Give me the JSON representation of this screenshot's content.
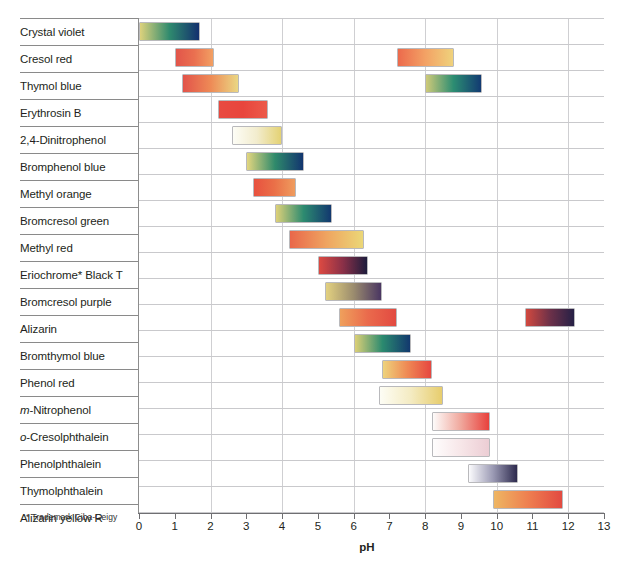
{
  "chart_data": {
    "type": "bar",
    "title": "",
    "subtitle": "",
    "xlabel": "pH",
    "ylabel": "",
    "xlim": [
      0,
      13
    ],
    "ylim": null,
    "grid": true,
    "grid_interval": 2,
    "legend": "none",
    "orientation": "horizontal",
    "note": "Horizontal gradient range bars showing pH transition intervals of acid-base indicators",
    "tick_labels": [
      "0",
      "1",
      "2",
      "3",
      "4",
      "5",
      "6",
      "7",
      "8",
      "9",
      "10",
      "11",
      "12",
      "13"
    ],
    "categories": [
      "Crystal violet",
      "Cresol red",
      "Thymol blue",
      "Erythrosin B",
      "2,4-Dinitrophenol",
      "Bromphenol blue",
      "Methyl orange",
      "Bromcresol green",
      "Methyl red",
      "Eriochrome* Black T",
      "Bromcresol purple",
      "Alizarin",
      "Bromthymol blue",
      "Phenol red",
      "m-Nitrophenol",
      "o-Cresolphthalein",
      "Phenolphthalein",
      "Thymolphthalein",
      "Alizarin yellow R"
    ],
    "indicators": [
      {
        "name": "Crystal violet",
        "label_html": "Crystal violet",
        "bands": [
          {
            "start": 0.0,
            "end": 1.7,
            "color_start": "#ddd27c",
            "color_mid": "#2f8a6e",
            "color_end": "#13306e"
          }
        ]
      },
      {
        "name": "Cresol red",
        "label_html": "Cresol red",
        "bands": [
          {
            "start": 1.0,
            "end": 2.1,
            "color_start": "#e2554a",
            "color_mid": "#ea7050",
            "color_end": "#f2a063"
          },
          {
            "start": 7.2,
            "end": 8.8,
            "color_start": "#ec6a4c",
            "color_mid": "#f3a265",
            "color_end": "#efd27c"
          }
        ]
      },
      {
        "name": "Thymol blue",
        "label_html": "Thymol blue",
        "bands": [
          {
            "start": 1.2,
            "end": 2.8,
            "color_start": "#e2534a",
            "color_mid": "#ee8a56",
            "color_end": "#ead784"
          },
          {
            "start": 8.0,
            "end": 9.6,
            "color_start": "#cfca79",
            "color_mid": "#2c8d72",
            "color_end": "#123a72"
          }
        ]
      },
      {
        "name": "Erythrosin B",
        "label_html": "Erythrosin B",
        "bands": [
          {
            "start": 2.2,
            "end": 3.6,
            "color_start": "#e84a41",
            "color_mid": "#e8453c",
            "color_end": "#ec5a4a"
          }
        ]
      },
      {
        "name": "2,4-Dinitrophenol",
        "label_html": "2,4-Dinitrophenol",
        "bands": [
          {
            "start": 2.6,
            "end": 4.0,
            "color_start": "#fdfdf6",
            "color_mid": "#f2eccd",
            "color_end": "#e4d274"
          }
        ]
      },
      {
        "name": "Bromphenol blue",
        "label_html": "Bromphenol blue",
        "bands": [
          {
            "start": 3.0,
            "end": 4.6,
            "color_start": "#e3d67f",
            "color_mid": "#2f8a6b",
            "color_end": "#12356f"
          }
        ]
      },
      {
        "name": "Methyl orange",
        "label_html": "Methyl orange",
        "bands": [
          {
            "start": 3.2,
            "end": 4.4,
            "color_start": "#e8513f",
            "color_mid": "#ea7048",
            "color_end": "#ef9c5e"
          }
        ]
      },
      {
        "name": "Bromcresol green",
        "label_html": "Bromcresol green",
        "bands": [
          {
            "start": 3.8,
            "end": 5.4,
            "color_start": "#ded179",
            "color_mid": "#2d8b70",
            "color_end": "#12386f"
          }
        ]
      },
      {
        "name": "Methyl red",
        "label_html": "Methyl red",
        "bands": [
          {
            "start": 4.2,
            "end": 6.3,
            "color_start": "#e9674a",
            "color_mid": "#efa460",
            "color_end": "#ebd777"
          }
        ]
      },
      {
        "name": "Eriochrome* Black T",
        "label_html": "Eriochrome* Black T",
        "bands": [
          {
            "start": 5.0,
            "end": 6.4,
            "color_start": "#dd4a42",
            "color_mid": "#8a3048",
            "color_end": "#1d1c3c"
          }
        ]
      },
      {
        "name": "Bromcresol purple",
        "label_html": "Bromcresol purple",
        "bands": [
          {
            "start": 5.2,
            "end": 6.8,
            "color_start": "#e3d180",
            "color_mid": "#9b8c6e",
            "color_end": "#4a3662"
          }
        ]
      },
      {
        "name": "Alizarin",
        "label_html": "Alizarin",
        "bands": [
          {
            "start": 5.6,
            "end": 7.2,
            "color_start": "#efa05c",
            "color_mid": "#ea6a4c",
            "color_end": "#e24a41"
          },
          {
            "start": 10.8,
            "end": 12.2,
            "color_start": "#d2493f",
            "color_mid": "#6d3149",
            "color_end": "#262046"
          }
        ]
      },
      {
        "name": "Bromthymol blue",
        "label_html": "Bromthymol blue",
        "bands": [
          {
            "start": 6.0,
            "end": 7.6,
            "color_start": "#dcd077",
            "color_mid": "#2b8a6f",
            "color_end": "#12386e"
          }
        ]
      },
      {
        "name": "Phenol red",
        "label_html": "Phenol red",
        "bands": [
          {
            "start": 6.8,
            "end": 8.2,
            "color_start": "#eed37c",
            "color_mid": "#ef8a55",
            "color_end": "#e64740"
          }
        ]
      },
      {
        "name": "m-Nitrophenol",
        "label_html": "<span class=\"ital\">m</span>-Nitrophenol",
        "bands": [
          {
            "start": 6.7,
            "end": 8.5,
            "color_start": "#fdfdf5",
            "color_mid": "#f4ebc2",
            "color_end": "#e7cd6d"
          }
        ]
      },
      {
        "name": "o-Cresolphthalein",
        "label_html": "<span class=\"ital\">o</span>-Cresolphthalein",
        "bands": [
          {
            "start": 8.2,
            "end": 9.8,
            "color_start": "#fdfbfa",
            "color_mid": "#f0a79c",
            "color_end": "#e8413c"
          }
        ]
      },
      {
        "name": "Phenolphthalein",
        "label_html": "Phenolphthalein",
        "bands": [
          {
            "start": 8.2,
            "end": 9.8,
            "color_start": "#fefdfd",
            "color_mid": "#f7e6e8",
            "color_end": "#eccdd4"
          }
        ]
      },
      {
        "name": "Thymolphthalein",
        "label_html": "Thymolphthalein",
        "bands": [
          {
            "start": 9.2,
            "end": 10.6,
            "color_start": "#fbfbfd",
            "color_mid": "#9b9ab4",
            "color_end": "#2d2a4e"
          }
        ]
      },
      {
        "name": "Alizarin yellow R",
        "label_html": "Alizarin yellow R",
        "bands": [
          {
            "start": 9.9,
            "end": 11.85,
            "color_start": "#eeb663",
            "color_mid": "#ee7f50",
            "color_end": "#e24a41"
          }
        ]
      }
    ]
  },
  "footnote": "* Trademark Ciba-Geigy",
  "axis": {
    "title": "pH"
  }
}
